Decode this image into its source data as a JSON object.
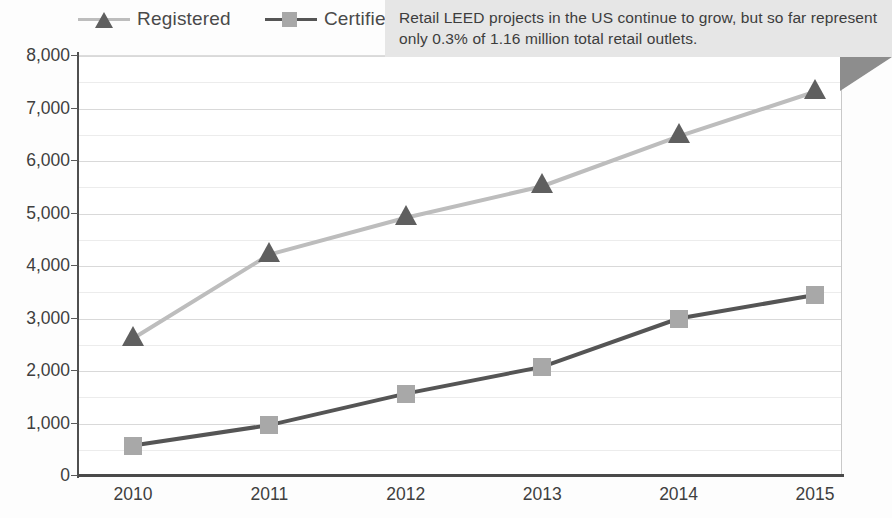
{
  "chart_data": {
    "type": "line",
    "title": "",
    "xlabel": "",
    "ylabel": "",
    "categories": [
      "2010",
      "2011",
      "2012",
      "2013",
      "2014",
      "2015"
    ],
    "ylim": [
      0,
      8000
    ],
    "ytick_labels": [
      "0",
      "1,000",
      "2,000",
      "3,000",
      "4,000",
      "5,000",
      "6,000",
      "7,000",
      "8,000"
    ],
    "ytick_values": [
      0,
      1000,
      2000,
      3000,
      4000,
      5000,
      6000,
      7000,
      8000
    ],
    "ytick_step": 1000,
    "minor_gridline_step": 500,
    "grid": true,
    "legend_position": "top-left",
    "series": [
      {
        "name": "Registered",
        "marker": "triangle",
        "line_color": "#bdbdbd",
        "marker_color": "#5f5f5f",
        "values": [
          2600,
          4200,
          4900,
          5500,
          6450,
          7300
        ]
      },
      {
        "name": "Certified",
        "marker": "square",
        "line_color": "#555555",
        "marker_color": "#a8a8a8",
        "values": [
          560,
          950,
          1550,
          2060,
          2980,
          3430
        ]
      }
    ],
    "annotations": [
      {
        "name": "callout",
        "text": "Retail LEED projects in the US continue to grow, but so far represent only 0.3% of 1.16 million total retail outlets.",
        "background": "#e6e6e6",
        "text_color": "#3d3d3d"
      }
    ]
  },
  "legend": {
    "items": [
      {
        "label": "Registered",
        "icon": "triangle-marker-icon"
      },
      {
        "label": "Certified",
        "icon": "square-marker-icon"
      }
    ]
  },
  "colors": {
    "registered_line": "#bdbdbd",
    "registered_marker": "#5f5f5f",
    "certified_line": "#555555",
    "certified_marker": "#a8a8a8",
    "grid_major": "#d9d9d9",
    "grid_minor": "#ececec",
    "axis": "#4a4a4a",
    "callout_bg": "#e6e6e6",
    "fold": "#8d8d8d"
  }
}
